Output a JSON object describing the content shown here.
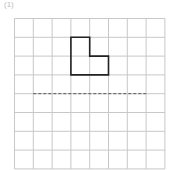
{
  "label": "(1)",
  "grid": {
    "cols": 8,
    "rows": 8,
    "x0": 14.5,
    "y0": 18.5,
    "cell": 18.8,
    "line_color": "#c8c8c8"
  },
  "shape": {
    "cells": [
      [
        3,
        1
      ],
      [
        3,
        2
      ],
      [
        4,
        2
      ]
    ],
    "stroke": "#222222"
  },
  "axis": {
    "row": 4,
    "from_col": 1,
    "to_col": 7,
    "style": "dashed",
    "color": "#555555"
  }
}
